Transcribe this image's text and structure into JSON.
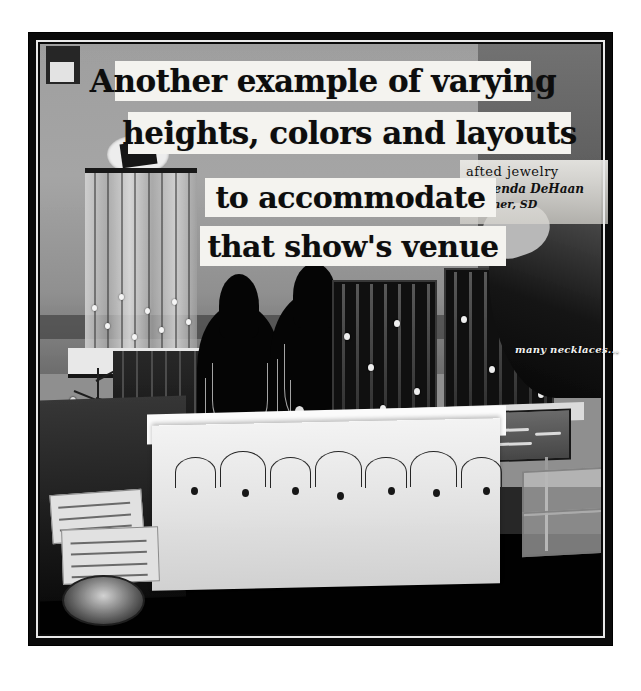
{
  "photo": {
    "caption_lines": [
      "Another example of varying",
      "heights, colors and layouts",
      "to accommodate",
      "that show's venue"
    ],
    "booth_sign": {
      "line1": "afted jewelry",
      "line2": "y Brenda DeHaan",
      "line3": "Wagner, SD"
    },
    "annotations": {
      "necklaces_label": "many necklaces..."
    },
    "colors": {
      "caption_background": "#f4f3ef",
      "caption_text": "#0d0d0d",
      "frame": "#0a0a0a",
      "page_background": "#ffffff",
      "label_text": "#f2f2f0"
    }
  }
}
